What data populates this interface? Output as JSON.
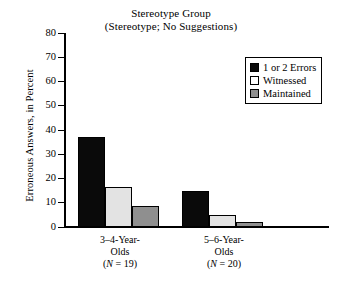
{
  "chart_data": {
    "type": "bar",
    "title": "Stereotype Group",
    "subtitle": "(Stereotype; No Suggestions)",
    "xlabel": "",
    "ylabel": "Erroneous Answers, in Percent",
    "ylim": [
      0,
      80
    ],
    "yticks": [
      80,
      70,
      60,
      50,
      40,
      30,
      20,
      10,
      0
    ],
    "grid": false,
    "legend_position": "upper right",
    "categories": [
      "3–4-Year-Olds",
      "5–6-Year-Olds"
    ],
    "category_lines": [
      {
        "line1": "3–4-Year-",
        "line2": "Olds",
        "line3_prefix": "(",
        "line3_italic": "N",
        "line3_suffix": " = 19)"
      },
      {
        "line1": "5–6-Year-",
        "line2": "Olds",
        "line3_prefix": "(",
        "line3_italic": "N",
        "line3_suffix": " = 20)"
      }
    ],
    "series": [
      {
        "name": "1 or 2 Errors",
        "color": "#0a0a0a",
        "values": [
          37,
          15
        ]
      },
      {
        "name": "Witnessed",
        "color": "#ffffff",
        "values": [
          16.5,
          5
        ]
      },
      {
        "name": "Maintained",
        "color": "#8f8f8f",
        "values": [
          8.5,
          2
        ]
      }
    ]
  },
  "legend": {
    "items": [
      {
        "label": "1 or 2 Errors",
        "swatch": "black-swatch"
      },
      {
        "label": "Witnessed",
        "swatch": "white-swatch"
      },
      {
        "label": "Maintained",
        "swatch": "gray-swatch"
      }
    ]
  }
}
